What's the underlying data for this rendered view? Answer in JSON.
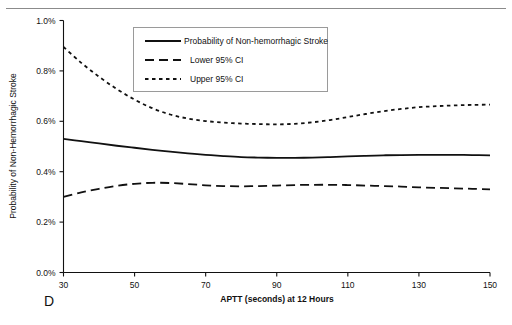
{
  "panel": {
    "label": "D"
  },
  "chart_data": {
    "type": "line",
    "title": "",
    "xlabel": "APTT (seconds) at 12 Hours",
    "ylabel": "Probability of Non-Hemorrhagic Stroke",
    "xlim": [
      30,
      150
    ],
    "ylim": [
      0.0,
      1.0
    ],
    "xticks": [
      30,
      50,
      70,
      90,
      110,
      130,
      150
    ],
    "xtick_labels": [
      "30",
      "50",
      "70",
      "90",
      "110",
      "130",
      "150"
    ],
    "yticks": [
      0.0,
      0.2,
      0.4,
      0.6,
      0.8,
      1.0
    ],
    "ytick_labels": [
      "0.0%",
      "0.2%",
      "0.4%",
      "0.6%",
      "0.8%",
      "1.0%"
    ],
    "grid": false,
    "legend_position": "upper-center",
    "x": [
      30,
      35,
      40,
      45,
      50,
      55,
      60,
      65,
      70,
      75,
      80,
      85,
      90,
      95,
      100,
      105,
      110,
      115,
      120,
      125,
      130,
      135,
      140,
      145,
      150
    ],
    "series": [
      {
        "name": "Probability of Non-hemorrhagic Stroke",
        "style": "solid",
        "values": [
          0.53,
          0.521,
          0.512,
          0.503,
          0.495,
          0.487,
          0.48,
          0.473,
          0.467,
          0.462,
          0.458,
          0.456,
          0.455,
          0.455,
          0.456,
          0.458,
          0.461,
          0.463,
          0.465,
          0.466,
          0.467,
          0.467,
          0.467,
          0.466,
          0.465
        ]
      },
      {
        "name": "Lower 95% CI",
        "style": "dashed",
        "values": [
          0.3,
          0.318,
          0.332,
          0.344,
          0.352,
          0.356,
          0.355,
          0.351,
          0.346,
          0.343,
          0.342,
          0.343,
          0.345,
          0.347,
          0.348,
          0.348,
          0.347,
          0.345,
          0.343,
          0.341,
          0.338,
          0.336,
          0.334,
          0.332,
          0.33
        ]
      },
      {
        "name": "Upper 95% CI",
        "style": "dotted",
        "values": [
          0.895,
          0.832,
          0.777,
          0.728,
          0.686,
          0.652,
          0.627,
          0.611,
          0.601,
          0.595,
          0.591,
          0.589,
          0.588,
          0.59,
          0.596,
          0.605,
          0.617,
          0.629,
          0.64,
          0.649,
          0.656,
          0.66,
          0.663,
          0.665,
          0.666
        ]
      }
    ]
  }
}
